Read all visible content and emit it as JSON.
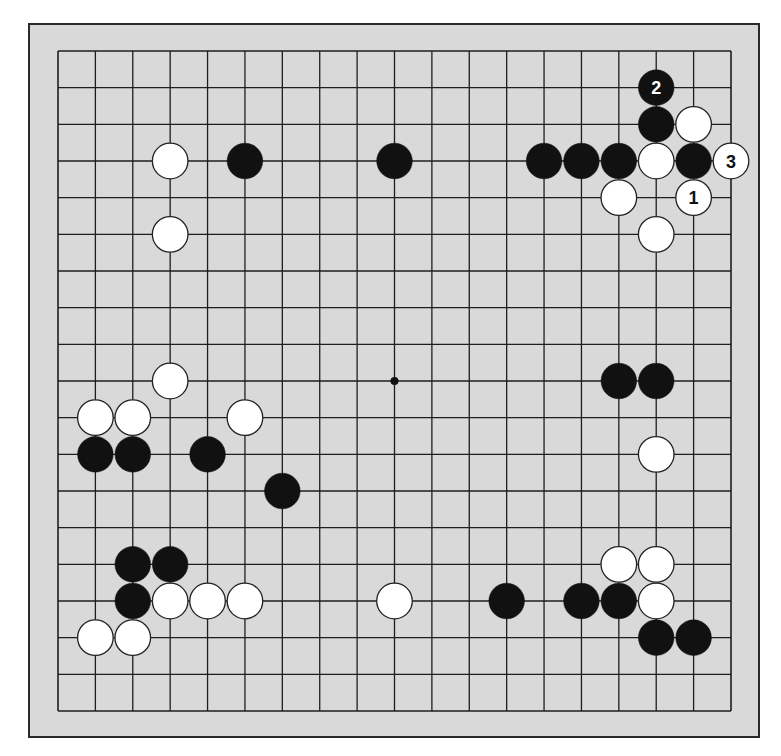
{
  "diagram": {
    "type": "go-board",
    "size": 19,
    "colors": {
      "board": "#d9d9d9",
      "line": "#1e1e1e",
      "black_stone": "#111111",
      "white_stone": "#ffffff",
      "stone_outline": "#222222"
    },
    "star_points": [
      [
        9,
        9
      ]
    ],
    "stones": [
      {
        "color": "white",
        "col": 3,
        "row": 3
      },
      {
        "color": "black",
        "col": 5,
        "row": 3
      },
      {
        "color": "black",
        "col": 9,
        "row": 3
      },
      {
        "color": "white",
        "col": 3,
        "row": 5
      },
      {
        "color": "black",
        "col": 13,
        "row": 3
      },
      {
        "color": "black",
        "col": 14,
        "row": 3
      },
      {
        "color": "black",
        "col": 15,
        "row": 3
      },
      {
        "color": "black",
        "col": 16,
        "row": 1,
        "label": "2"
      },
      {
        "color": "black",
        "col": 16,
        "row": 2
      },
      {
        "color": "white",
        "col": 17,
        "row": 2
      },
      {
        "color": "white",
        "col": 16,
        "row": 3
      },
      {
        "color": "black",
        "col": 17,
        "row": 3
      },
      {
        "color": "white",
        "col": 18,
        "row": 3,
        "label": "3"
      },
      {
        "color": "white",
        "col": 15,
        "row": 4
      },
      {
        "color": "white",
        "col": 17,
        "row": 4,
        "label": "1"
      },
      {
        "color": "white",
        "col": 16,
        "row": 5
      },
      {
        "color": "white",
        "col": 3,
        "row": 9
      },
      {
        "color": "white",
        "col": 1,
        "row": 10
      },
      {
        "color": "white",
        "col": 2,
        "row": 10
      },
      {
        "color": "white",
        "col": 5,
        "row": 10
      },
      {
        "color": "black",
        "col": 1,
        "row": 11
      },
      {
        "color": "black",
        "col": 2,
        "row": 11
      },
      {
        "color": "black",
        "col": 4,
        "row": 11
      },
      {
        "color": "black",
        "col": 6,
        "row": 12
      },
      {
        "color": "black",
        "col": 15,
        "row": 9
      },
      {
        "color": "black",
        "col": 16,
        "row": 9
      },
      {
        "color": "white",
        "col": 16,
        "row": 11
      },
      {
        "color": "black",
        "col": 2,
        "row": 14
      },
      {
        "color": "black",
        "col": 3,
        "row": 14
      },
      {
        "color": "black",
        "col": 2,
        "row": 15
      },
      {
        "color": "white",
        "col": 3,
        "row": 15
      },
      {
        "color": "white",
        "col": 4,
        "row": 15
      },
      {
        "color": "white",
        "col": 5,
        "row": 15
      },
      {
        "color": "white",
        "col": 1,
        "row": 16
      },
      {
        "color": "white",
        "col": 2,
        "row": 16
      },
      {
        "color": "white",
        "col": 9,
        "row": 15
      },
      {
        "color": "black",
        "col": 12,
        "row": 15
      },
      {
        "color": "black",
        "col": 14,
        "row": 15
      },
      {
        "color": "black",
        "col": 15,
        "row": 15
      },
      {
        "color": "white",
        "col": 16,
        "row": 15
      },
      {
        "color": "white",
        "col": 15,
        "row": 14
      },
      {
        "color": "white",
        "col": 16,
        "row": 14
      },
      {
        "color": "black",
        "col": 16,
        "row": 16
      },
      {
        "color": "black",
        "col": 17,
        "row": 16
      }
    ]
  }
}
